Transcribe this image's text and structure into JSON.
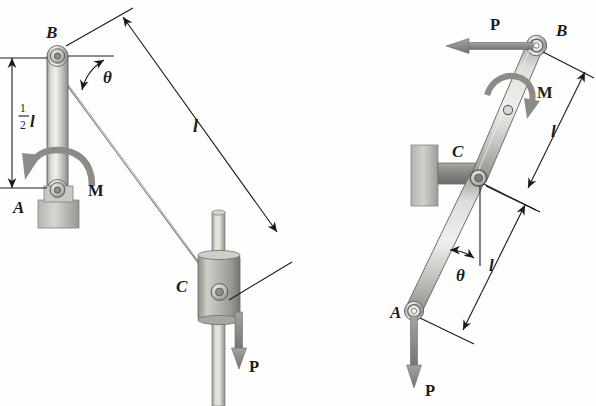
{
  "figure": {
    "background_color": "#fefefe",
    "ink_color": "#1c1c1c",
    "metal_light": "#e8e8e6",
    "metal_mid": "#b9b9b5",
    "metal_dark": "#8f8f8b",
    "metal_shadow": "#6d6d6a"
  },
  "left_diagram": {
    "name": "left-mechanism-view",
    "labels": {
      "point_b": "B",
      "point_a": "A",
      "point_c": "C",
      "moment": "M",
      "force": "P",
      "angle": "θ",
      "length_l": "l",
      "half_length_numerator": "1",
      "half_length_denominator": "2",
      "half_length_unit": "l"
    },
    "geometry": {
      "pivot_b": [
        57,
        56
      ],
      "pivot_a": [
        58,
        190
      ],
      "pivot_c": [
        220,
        292
      ],
      "link_ab_length_label": "1/2 l",
      "link_bc_length_label": "l",
      "angle_from_horizontal": "θ",
      "dimension_ab_x": 12,
      "dimension_ab_top_y": 58,
      "dimension_ab_bottom_y": 188,
      "dimension_bc_start": [
        123,
        17
      ],
      "dimension_bc_end": [
        277,
        232
      ],
      "force_p_direction": "down",
      "moment_m_direction": "counterclockwise"
    }
  },
  "right_diagram": {
    "name": "right-mechanism-view",
    "labels": {
      "point_b": "B",
      "point_c": "C",
      "point_a": "A",
      "moment": "M",
      "force_top": "P",
      "force_bottom": "P",
      "angle": "θ",
      "length_upper": "l",
      "length_lower": "l"
    },
    "geometry": {
      "pivot_b": [
        536,
        46
      ],
      "pivot_c": [
        478,
        178
      ],
      "pivot_a": [
        414,
        311
      ],
      "dimension_upper_start": [
        585,
        72
      ],
      "dimension_upper_end": [
        528,
        188
      ],
      "dimension_lower_start": [
        525,
        205
      ],
      "dimension_lower_end": [
        463,
        330
      ],
      "force_p_top_direction": "left",
      "force_p_bottom_direction": "down",
      "moment_m_direction": "clockwise",
      "angle_from_vertical": "θ"
    }
  }
}
